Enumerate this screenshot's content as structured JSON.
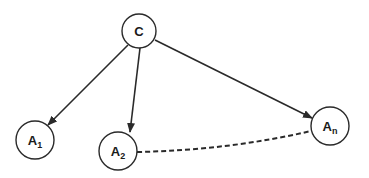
{
  "diagram": {
    "nodes": [
      {
        "id": "C",
        "label": "C",
        "sub": "",
        "cx": 139,
        "cy": 31,
        "r": 17
      },
      {
        "id": "A1",
        "label": "A",
        "sub": "1",
        "cx": 35,
        "cy": 140,
        "r": 19
      },
      {
        "id": "A2",
        "label": "A",
        "sub": "2",
        "cx": 118,
        "cy": 151,
        "r": 19
      },
      {
        "id": "An",
        "label": "A",
        "sub": "n",
        "cx": 330,
        "cy": 126,
        "r": 19
      }
    ],
    "edges": [
      {
        "from": "C",
        "to": "A1",
        "style": "solid-arrow"
      },
      {
        "from": "C",
        "to": "A2",
        "style": "solid-arrow"
      },
      {
        "from": "C",
        "to": "An",
        "style": "solid-arrow"
      },
      {
        "from": "A2",
        "to": "An",
        "style": "dashed-curve"
      }
    ],
    "colors": {
      "stroke": "#2a2a2a",
      "background": "#ffffff"
    }
  }
}
